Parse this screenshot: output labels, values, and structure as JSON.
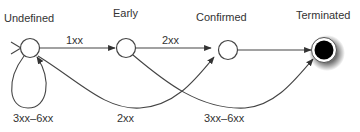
{
  "diagram": {
    "type": "state-diagram",
    "states": [
      {
        "id": "undefined",
        "label": "Undefined",
        "kind": "state"
      },
      {
        "id": "early",
        "label": "Early",
        "kind": "state"
      },
      {
        "id": "confirmed",
        "label": "Confirmed",
        "kind": "state"
      },
      {
        "id": "terminated",
        "label": "Terminated",
        "kind": "final-state"
      }
    ],
    "transitions": [
      {
        "from": "undefined",
        "to": "early",
        "label": "1xx"
      },
      {
        "from": "early",
        "to": "confirmed",
        "label": "2xx"
      },
      {
        "from": "confirmed",
        "to": "terminated",
        "label": ""
      },
      {
        "from": "undefined",
        "to": "undefined",
        "label": "3xx–6xx"
      },
      {
        "from": "early",
        "to": "undefined",
        "label": ""
      },
      {
        "from": "undefined",
        "to": "confirmed",
        "label": "2xx"
      },
      {
        "from": "early",
        "to": "terminated",
        "label": "3xx–6xx"
      }
    ],
    "edge_labels": {
      "undefined_early": "1xx",
      "early_confirmed": "2xx",
      "self_loop": "3xx–6xx",
      "bottom_left": "2xx",
      "bottom_right": "3xx–6xx"
    },
    "colors": {
      "stroke": "#444444",
      "text": "#333333",
      "final_fill": "#000000"
    }
  }
}
